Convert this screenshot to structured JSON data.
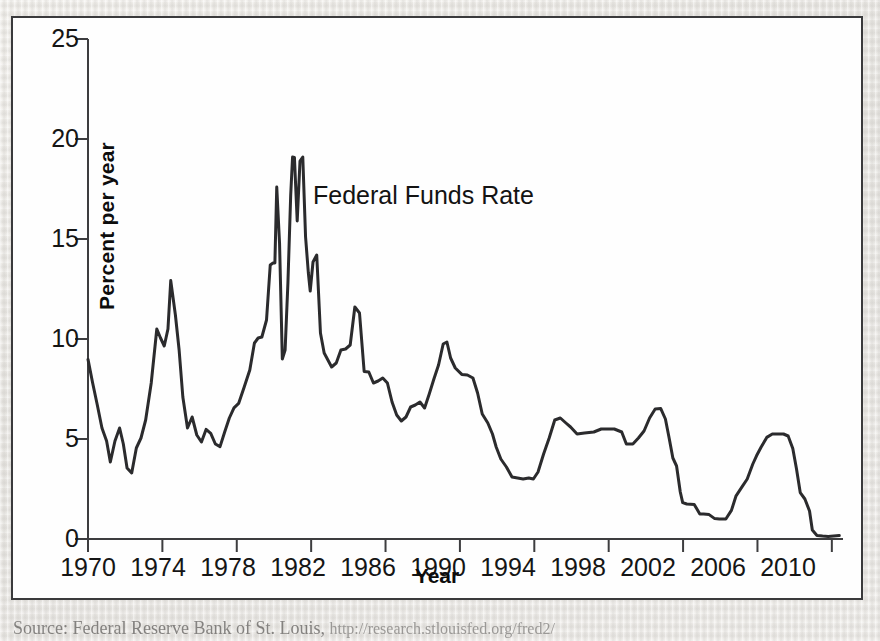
{
  "figure": {
    "series_annotation": "Federal Funds Rate",
    "source_caption": "Source: Federal Reserve Bank of St. Louis,",
    "source_url": "http://research.stlouisfed.org/fred2/"
  },
  "chart_data": {
    "type": "line",
    "title": "",
    "subtitle": "",
    "xlabel": "Year",
    "ylabel": "Percent per year",
    "xlim": [
      1970,
      2010.6
    ],
    "ylim": [
      0,
      25
    ],
    "xticks": [
      1970,
      1974,
      1978,
      1982,
      1986,
      1990,
      1994,
      1998,
      2002,
      2006,
      2010
    ],
    "yticks": [
      0,
      5,
      10,
      15,
      20,
      25
    ],
    "grid": false,
    "legend_position": "inline-annotation",
    "line_color": "#2b2b2d",
    "line_width": 3.0,
    "series": [
      {
        "name": "Federal Funds Rate",
        "x": [
          1970.0,
          1970.25,
          1970.5,
          1970.75,
          1971.0,
          1971.2,
          1971.45,
          1971.7,
          1971.9,
          1972.1,
          1972.35,
          1972.6,
          1972.85,
          1973.1,
          1973.4,
          1973.7,
          1973.9,
          1974.1,
          1974.3,
          1974.45,
          1974.7,
          1974.9,
          1975.1,
          1975.35,
          1975.6,
          1975.85,
          1976.1,
          1976.35,
          1976.6,
          1976.85,
          1977.1,
          1977.35,
          1977.6,
          1977.85,
          1978.1,
          1978.4,
          1978.7,
          1978.95,
          1979.15,
          1979.35,
          1979.6,
          1979.8,
          1979.95,
          1980.05,
          1980.15,
          1980.3,
          1980.45,
          1980.6,
          1980.75,
          1980.9,
          1981.0,
          1981.1,
          1981.25,
          1981.4,
          1981.55,
          1981.7,
          1981.85,
          1981.95,
          1982.1,
          1982.3,
          1982.5,
          1982.7,
          1982.9,
          1983.1,
          1983.35,
          1983.6,
          1983.85,
          1984.1,
          1984.35,
          1984.6,
          1984.85,
          1985.1,
          1985.35,
          1985.6,
          1985.85,
          1986.1,
          1986.35,
          1986.6,
          1986.85,
          1987.1,
          1987.35,
          1987.6,
          1987.85,
          1988.1,
          1988.35,
          1988.6,
          1988.85,
          1989.1,
          1989.3,
          1989.5,
          1989.75,
          1990.1,
          1990.4,
          1990.7,
          1990.95,
          1991.2,
          1991.5,
          1991.75,
          1991.95,
          1992.2,
          1992.5,
          1992.8,
          1993.1,
          1993.4,
          1993.7,
          1993.95,
          1994.2,
          1994.5,
          1994.8,
          1995.1,
          1995.4,
          1995.7,
          1995.95,
          1996.3,
          1996.7,
          1997.2,
          1997.6,
          1997.95,
          1998.3,
          1998.7,
          1998.95,
          1999.3,
          1999.6,
          1999.9,
          2000.2,
          2000.5,
          2000.8,
          2001.05,
          2001.25,
          2001.45,
          2001.65,
          2001.85,
          2001.98,
          2002.2,
          2002.6,
          2002.9,
          2003.1,
          2003.4,
          2003.7,
          2003.95,
          2004.3,
          2004.6,
          2004.85,
          2005.15,
          2005.45,
          2005.75,
          2005.95,
          2006.2,
          2006.5,
          2006.8,
          2007.1,
          2007.4,
          2007.65,
          2007.9,
          2008.1,
          2008.3,
          2008.55,
          2008.8,
          2008.95,
          2009.2,
          2009.5,
          2009.8,
          2010.1,
          2010.4
        ],
        "y": [
          8.98,
          7.8,
          6.7,
          5.55,
          4.9,
          3.85,
          4.9,
          5.55,
          4.75,
          3.55,
          3.3,
          4.55,
          5.05,
          5.95,
          7.8,
          10.5,
          10.05,
          9.65,
          10.5,
          12.92,
          11.2,
          9.45,
          7.1,
          5.55,
          6.1,
          5.2,
          4.85,
          5.48,
          5.28,
          4.75,
          4.62,
          5.35,
          6.05,
          6.56,
          6.78,
          7.6,
          8.45,
          9.8,
          10.05,
          10.1,
          10.95,
          13.7,
          13.8,
          13.8,
          17.6,
          14.8,
          9.0,
          9.45,
          12.8,
          17.2,
          19.1,
          19.08,
          15.9,
          18.9,
          19.1,
          15.1,
          13.3,
          12.4,
          13.85,
          14.2,
          10.3,
          9.3,
          8.95,
          8.6,
          8.8,
          9.45,
          9.5,
          9.7,
          11.6,
          11.3,
          8.38,
          8.35,
          7.8,
          7.9,
          8.05,
          7.8,
          6.85,
          6.2,
          5.9,
          6.1,
          6.6,
          6.7,
          6.85,
          6.55,
          7.25,
          8.0,
          8.7,
          9.75,
          9.85,
          9.05,
          8.55,
          8.23,
          8.2,
          8.05,
          7.3,
          6.25,
          5.8,
          5.25,
          4.6,
          4.0,
          3.6,
          3.1,
          3.05,
          3.0,
          3.05,
          3.0,
          3.35,
          4.25,
          5.05,
          5.95,
          6.05,
          5.8,
          5.6,
          5.25,
          5.3,
          5.35,
          5.5,
          5.5,
          5.5,
          5.35,
          4.75,
          4.75,
          5.05,
          5.4,
          6.05,
          6.5,
          6.52,
          6.0,
          5.05,
          4.05,
          3.65,
          2.35,
          1.82,
          1.75,
          1.73,
          1.25,
          1.25,
          1.22,
          1.02,
          1.0,
          1.0,
          1.43,
          2.16,
          2.58,
          3.0,
          3.75,
          4.16,
          4.6,
          5.08,
          5.25,
          5.25,
          5.25,
          5.15,
          4.52,
          3.5,
          2.32,
          2.0,
          1.4,
          0.45,
          0.18,
          0.15,
          0.13,
          0.15,
          0.17
        ]
      }
    ]
  }
}
